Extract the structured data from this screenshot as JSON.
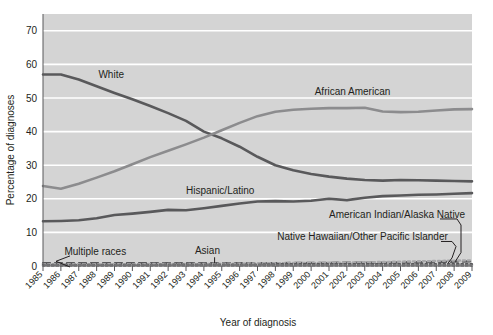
{
  "chart_data": {
    "type": "line",
    "title": "",
    "xlabel": "Year of diagnosis",
    "ylabel": "Percentage of diagnoses",
    "ylim": [
      0,
      75
    ],
    "yticks": [
      0,
      10,
      20,
      30,
      40,
      50,
      60,
      70
    ],
    "grid": true,
    "legend_position": "inline-annotations",
    "plot_background": "#d4d4d4",
    "x": [
      1985,
      1986,
      1987,
      1988,
      1989,
      1990,
      1991,
      1992,
      1993,
      1994,
      1995,
      1996,
      1997,
      1998,
      1999,
      2000,
      2001,
      2002,
      2003,
      2004,
      2005,
      2006,
      2007,
      2008,
      2009
    ],
    "xtick_labels": [
      "1985",
      "1986",
      "1987",
      "1988",
      "1989",
      "1990",
      "1991",
      "1992",
      "1993",
      "1994",
      "1995",
      "1996",
      "1997",
      "1998",
      "1999",
      "2000",
      "2001",
      "2002",
      "2003",
      "2004",
      "2005",
      "2006",
      "2007",
      "2008",
      "2009"
    ],
    "series": [
      {
        "name": "White",
        "color": "#59595b",
        "label": "White",
        "label_x": 1988.1,
        "label_y": 56.0,
        "values": [
          57.0,
          57.0,
          55.5,
          53.5,
          51.5,
          49.6,
          47.6,
          45.5,
          43.2,
          40.0,
          38.0,
          35.5,
          32.5,
          30.0,
          28.5,
          27.4,
          26.6,
          26.0,
          25.6,
          25.4,
          25.6,
          25.5,
          25.4,
          25.3,
          25.2
        ]
      },
      {
        "name": "African American",
        "color": "#8c8c8e",
        "label": "African American",
        "label_x": 2000.2,
        "label_y": 51.0,
        "values": [
          23.8,
          23.0,
          24.5,
          26.3,
          28.2,
          30.3,
          32.4,
          34.3,
          36.2,
          38.2,
          40.4,
          42.6,
          44.6,
          45.9,
          46.5,
          46.8,
          47.0,
          47.0,
          47.1,
          46.0,
          45.8,
          45.9,
          46.3,
          46.6,
          46.7
        ]
      },
      {
        "name": "Hispanic/Latino",
        "color": "#59595b",
        "label": "Hispanic/Latino",
        "label_x": 1993.0,
        "label_y": 21.4,
        "values": [
          13.3,
          13.4,
          13.6,
          14.2,
          15.2,
          15.6,
          16.1,
          16.7,
          16.6,
          17.2,
          17.9,
          18.6,
          19.2,
          19.3,
          19.2,
          19.4,
          20.0,
          19.6,
          20.3,
          20.8,
          21.0,
          21.2,
          21.3,
          21.5,
          21.7
        ]
      },
      {
        "name": "Multiple races",
        "color": "#59595b",
        "label": "Multiple races",
        "label_x": 1986.2,
        "label_y": 3.3,
        "values": [
          0.8,
          0.8,
          0.8,
          0.8,
          0.8,
          0.8,
          0.8,
          0.8,
          0.8,
          0.8,
          0.8,
          0.8,
          0.8,
          0.8,
          0.9,
          0.9,
          0.9,
          1.0,
          1.0,
          1.0,
          1.1,
          1.1,
          1.2,
          1.3,
          1.4
        ]
      },
      {
        "name": "Asian",
        "color": "#a8a8aa",
        "label": "Asian",
        "label_x": 1993.5,
        "label_y": 3.6,
        "values": [
          0.5,
          0.5,
          0.5,
          0.5,
          0.5,
          0.5,
          0.6,
          0.6,
          0.6,
          0.6,
          0.7,
          0.7,
          0.8,
          0.8,
          0.9,
          0.9,
          1.0,
          1.0,
          1.1,
          1.2,
          1.3,
          1.4,
          1.5,
          1.6,
          1.7
        ]
      },
      {
        "name": "American Indian/Alaska Native",
        "color": "#59595b",
        "label": "American Indian/Alaska Native",
        "label_x": 2001.0,
        "label_y": 14.3,
        "values": [
          0.3,
          0.3,
          0.3,
          0.3,
          0.3,
          0.3,
          0.3,
          0.4,
          0.4,
          0.4,
          0.4,
          0.4,
          0.4,
          0.5,
          0.5,
          0.5,
          0.5,
          0.5,
          0.5,
          0.5,
          0.5,
          0.5,
          0.5,
          0.5,
          0.5
        ]
      },
      {
        "name": "Native Hawaiian/Other Pacific Islander",
        "color": "#8c8c8e",
        "label": "Native Hawaiian/Other Pacific Islander",
        "label_x": 1998.1,
        "label_y": 7.6,
        "values": [
          0.1,
          0.1,
          0.1,
          0.1,
          0.1,
          0.1,
          0.1,
          0.1,
          0.1,
          0.1,
          0.1,
          0.1,
          0.1,
          0.1,
          0.1,
          0.1,
          0.1,
          0.1,
          0.1,
          0.1,
          0.1,
          0.1,
          0.1,
          0.1,
          0.1
        ]
      }
    ]
  }
}
